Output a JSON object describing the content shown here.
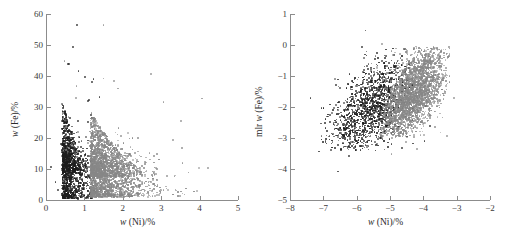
{
  "figure": {
    "background": "#ffffff",
    "panel_count": 2
  },
  "colors": {
    "dark_series": "#1d1d1d",
    "gray_series": "#878787",
    "axis": "#8c8c8c",
    "text": "#2a2a2a"
  },
  "chart_data": [
    {
      "type": "scatter",
      "panel": "left",
      "title": "",
      "xlabel": "w (Ni)/%",
      "ylabel": "w (Fe)/%",
      "xlabel_parts": {
        "symbol": "w",
        "rest": " (Ni)/%"
      },
      "ylabel_parts": {
        "prefix": "",
        "symbol": "w",
        "rest": " (Fe)/%"
      },
      "xlim": [
        0,
        5
      ],
      "ylim": [
        0,
        60
      ],
      "xticks": [
        0,
        1,
        2,
        3,
        4,
        5
      ],
      "yticks": [
        0,
        10,
        20,
        30,
        40,
        50,
        60
      ],
      "xticklabels": [
        "0",
        "1",
        "2",
        "3",
        "4",
        "5"
      ],
      "yticklabels": [
        "0",
        "10",
        "20",
        "30",
        "40",
        "50",
        "60"
      ],
      "grid": false,
      "legend": null,
      "series": [
        {
          "name": "dark-population",
          "color": "#1d1d1d",
          "n_points": 1500,
          "cluster": {
            "x_mode": 0.42,
            "x_spread": 0.3,
            "y_mode": 14,
            "y_spread": 13,
            "x_min": 0.05,
            "x_max": 1.45,
            "y_min": 0.5,
            "y_max": 53
          }
        },
        {
          "name": "gray-population",
          "color": "#878787",
          "n_points": 2600,
          "cluster": {
            "x_mode": 1.15,
            "x_spread": 0.62,
            "y_mode": 12,
            "y_spread": 11,
            "x_min": 0.3,
            "x_max": 4.6,
            "y_min": 1.0,
            "y_max": 50
          }
        }
      ]
    },
    {
      "type": "scatter",
      "panel": "right",
      "title": "",
      "xlabel": "w (Ni)/%",
      "ylabel": "mlr w (Fe)/%",
      "xlabel_parts": {
        "symbol": "w",
        "rest": " (Ni)/%"
      },
      "ylabel_parts": {
        "prefix": "mlr ",
        "symbol": "w",
        "rest": " (Fe)/%"
      },
      "xlim": [
        -8,
        -2
      ],
      "ylim": [
        -5,
        1
      ],
      "xticks": [
        -8,
        -7,
        -6,
        -5,
        -4,
        -3,
        -2
      ],
      "yticks": [
        -5,
        -4,
        -3,
        -2,
        -1,
        0,
        1
      ],
      "xticklabels": [
        "-8",
        "-7",
        "-6",
        "-5",
        "-4",
        "-3",
        "-2"
      ],
      "yticklabels": [
        "-5",
        "-4",
        "-3",
        "-2",
        "-1",
        "0",
        "1"
      ],
      "grid": false,
      "legend": null,
      "series": [
        {
          "name": "dark-population",
          "color": "#1d1d1d",
          "n_points": 1500,
          "cluster": {
            "x_mode": -5.55,
            "x_spread": 0.62,
            "y_mode": -2.05,
            "y_spread": 0.8,
            "x_min": -7.1,
            "x_max": -4.3,
            "y_min": -3.4,
            "y_max": -0.1
          }
        },
        {
          "name": "gray-population",
          "color": "#878787",
          "n_points": 2600,
          "cluster": {
            "x_mode": -4.3,
            "x_spread": 0.48,
            "y_mode": -1.55,
            "y_spread": 0.75,
            "x_min": -5.6,
            "x_max": -3.2,
            "y_min": -3.0,
            "y_max": -0.05
          }
        }
      ]
    }
  ],
  "geometry": {
    "left_panel": {
      "plot_x": 46,
      "plot_y": 14,
      "plot_w": 192,
      "plot_h": 186
    },
    "right_panel": {
      "plot_x": 38,
      "plot_y": 14,
      "plot_w": 200,
      "plot_h": 186
    }
  }
}
